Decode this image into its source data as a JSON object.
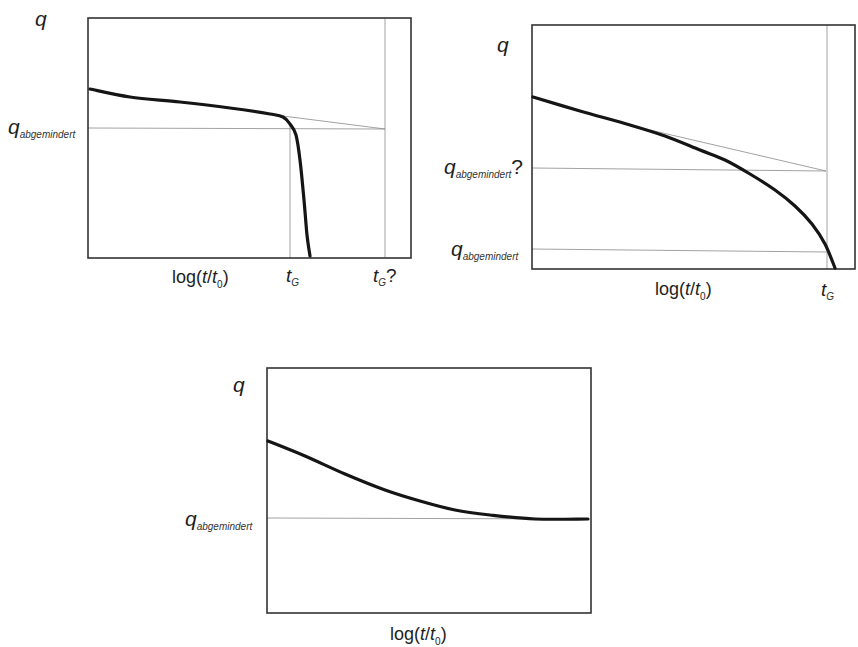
{
  "figure": {
    "colors": {
      "curve": "#151515",
      "frame": "#333333",
      "helper_line": "#8a8a8a",
      "background": "#ffffff"
    }
  },
  "panels": [
    {
      "id": "top-left",
      "y_axis_label": "q",
      "x_axis_label": {
        "prefix": "log(",
        "t": "t",
        "slash": "/",
        "t0": "t",
        "sub0": "0",
        "suffix": ")"
      },
      "q_label": {
        "main": "q",
        "sub": "abgemindert",
        "suffix": ""
      },
      "tg_labels": [
        {
          "main": "t",
          "sub": "G",
          "suffix": ""
        },
        {
          "main": "t",
          "sub": "G",
          "suffix": "?"
        }
      ]
    },
    {
      "id": "top-right",
      "y_axis_label": "q",
      "x_axis_label": {
        "prefix": "log(",
        "t": "t",
        "slash": "/",
        "t0": "t",
        "sub0": "0",
        "suffix": ")"
      },
      "q_labels": [
        {
          "main": "q",
          "sub": "abgemindert",
          "suffix": "?"
        },
        {
          "main": "q",
          "sub": "abgemindert",
          "suffix": ""
        }
      ],
      "tg_label": {
        "main": "t",
        "sub": "G",
        "suffix": ""
      }
    },
    {
      "id": "bottom",
      "y_axis_label": "q",
      "x_axis_label": {
        "prefix": "log(",
        "t": "t",
        "slash": "/",
        "t0": "t",
        "sub0": "0",
        "suffix": ")"
      },
      "q_label": {
        "main": "q",
        "sub": "abgemindert",
        "suffix": ""
      }
    }
  ],
  "chart_data": [
    {
      "type": "line",
      "title": "",
      "xlabel": "log(t/t0)",
      "ylabel": "q",
      "grid": false,
      "description": "Load q over log time: slow linear decline then sudden failure at t_G; extrapolated tangent reaches q_abgemindert at t_G?",
      "x_ticks": [
        "t_G",
        "t_G?"
      ],
      "y_ticks": [
        "q_abgemindert"
      ],
      "frame_px": {
        "x0": 88,
        "y0": 18,
        "x1": 411,
        "y1": 258
      },
      "series": [
        {
          "name": "q(t)",
          "style": "thick",
          "points_px": [
            [
              90,
              89
            ],
            [
              130,
              97
            ],
            [
              180,
              102
            ],
            [
              230,
              108
            ],
            [
              270,
              114
            ],
            [
              283,
              117
            ],
            [
              290,
              124
            ],
            [
              296,
              135
            ],
            [
              300,
              160
            ],
            [
              304,
              200
            ],
            [
              307,
              235
            ],
            [
              310,
              256
            ]
          ]
        },
        {
          "name": "tangent extrapolation",
          "style": "thin",
          "points_px": [
            [
              283,
              116
            ],
            [
              385,
              129
            ]
          ]
        },
        {
          "name": "q_abgemindert level",
          "style": "thin",
          "points_px": [
            [
              88,
              128
            ],
            [
              385,
              129
            ]
          ]
        },
        {
          "name": "t_G marker",
          "style": "thin",
          "points_px": [
            [
              290,
              125
            ],
            [
              290,
              258
            ]
          ]
        },
        {
          "name": "t_G? marker",
          "style": "thin",
          "points_px": [
            [
              385,
              18
            ],
            [
              385,
              258
            ]
          ]
        }
      ]
    },
    {
      "type": "line",
      "title": "",
      "xlabel": "log(t/t0)",
      "ylabel": "q",
      "grid": false,
      "description": "Load q over log time: concave progressive decline reaching failure at t_G; tangent extrapolation gives q_abgemindert? above true q_abgemindert",
      "x_ticks": [
        "t_G"
      ],
      "y_ticks": [
        "q_abgemindert?",
        "q_abgemindert"
      ],
      "frame_px": {
        "x0": 532,
        "y0": 25,
        "x1": 855,
        "y1": 269
      },
      "series": [
        {
          "name": "q(t)",
          "style": "thick",
          "points_px": [
            [
              533,
              97
            ],
            [
              580,
              111
            ],
            [
              630,
              125
            ],
            [
              665,
              136
            ],
            [
              700,
              150
            ],
            [
              725,
              160
            ],
            [
              750,
              174
            ],
            [
              775,
              190
            ],
            [
              795,
              206
            ],
            [
              812,
              224
            ],
            [
              825,
              244
            ],
            [
              835,
              268
            ]
          ]
        },
        {
          "name": "tangent extrapolation",
          "style": "thin",
          "points_px": [
            [
              650,
              130
            ],
            [
              826,
              171
            ]
          ]
        },
        {
          "name": "q_abgemindert? level",
          "style": "thin",
          "points_px": [
            [
              532,
              168
            ],
            [
              826,
              171
            ]
          ]
        },
        {
          "name": "q_abgemindert level",
          "style": "thin",
          "points_px": [
            [
              532,
              249
            ],
            [
              826,
              252
            ]
          ]
        },
        {
          "name": "t_G marker",
          "style": "thin",
          "points_px": [
            [
              827,
              25
            ],
            [
              827,
              269
            ]
          ]
        }
      ]
    },
    {
      "type": "line",
      "title": "",
      "xlabel": "log(t/t0)",
      "ylabel": "q",
      "grid": false,
      "description": "Load q over log time: decline that asymptotically levels off at q_abgemindert (no failure)",
      "y_ticks": [
        "q_abgemindert"
      ],
      "frame_px": {
        "x0": 267,
        "y0": 368,
        "x1": 591,
        "y1": 613
      },
      "series": [
        {
          "name": "q(t)",
          "style": "thick",
          "points_px": [
            [
              268,
              441
            ],
            [
              305,
              456
            ],
            [
              345,
              474
            ],
            [
              385,
              490
            ],
            [
              420,
              501
            ],
            [
              455,
              510
            ],
            [
              490,
              515
            ],
            [
              535,
              519
            ],
            [
              588,
              519
            ]
          ]
        },
        {
          "name": "q_abgemindert level",
          "style": "thin",
          "points_px": [
            [
              267,
              518
            ],
            [
              588,
              519
            ]
          ]
        }
      ]
    }
  ]
}
